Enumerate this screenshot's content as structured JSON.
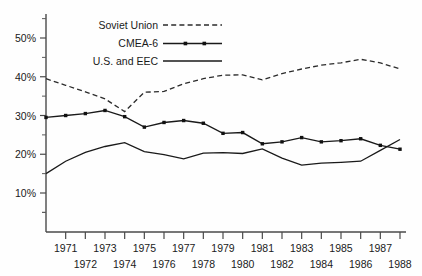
{
  "chart_data": {
    "type": "line",
    "title": "",
    "xlabel": "",
    "ylabel": "",
    "grid": false,
    "legend_position": "top-center",
    "x": [
      1970,
      1971,
      1972,
      1973,
      1974,
      1975,
      1976,
      1977,
      1978,
      1979,
      1980,
      1981,
      1982,
      1983,
      1984,
      1985,
      1986,
      1987,
      1988
    ],
    "categories": [
      "1970",
      "1971",
      "1972",
      "1973",
      "1974",
      "1975",
      "1976",
      "1977",
      "1978",
      "1979",
      "1980",
      "1981",
      "1982",
      "1983",
      "1984",
      "1985",
      "1986",
      "1987",
      "1988"
    ],
    "xlim": [
      1970,
      1988
    ],
    "ylim": [
      2.5,
      55
    ],
    "y_ticks_major": [
      10,
      20,
      30,
      40,
      50
    ],
    "y_ticks_major_labels": [
      "10%",
      "20%",
      "30%",
      "40%",
      "50%"
    ],
    "y_ticks_minor": [
      5,
      15,
      25,
      35,
      45,
      55
    ],
    "x_tick_labels_top": [
      "1971",
      "1973",
      "1975",
      "1977",
      "1979",
      "1981",
      "1983",
      "1985",
      "1987"
    ],
    "x_tick_labels_bottom": [
      "1972",
      "1974",
      "1976",
      "1978",
      "1980",
      "1982",
      "1984",
      "1986",
      "1988"
    ],
    "series": [
      {
        "name": "Soviet Union",
        "style": "dashed",
        "markers": false,
        "color": "#2b2b2b",
        "values": [
          39.5,
          37.8,
          36.1,
          34.3,
          31.0,
          36.0,
          36.2,
          38.2,
          39.5,
          40.4,
          40.5,
          39.2,
          40.8,
          42.0,
          43.0,
          43.6,
          44.5,
          43.6,
          42.0
        ]
      },
      {
        "name": "CMEA-6",
        "style": "solid",
        "markers": true,
        "color": "#1a1a1a",
        "values": [
          29.5,
          30.0,
          30.5,
          31.3,
          29.7,
          27.0,
          28.2,
          28.7,
          28.0,
          25.4,
          25.6,
          22.7,
          23.2,
          24.3,
          23.2,
          23.5,
          24.0,
          22.3,
          21.3
        ]
      },
      {
        "name": "U.S. and EEC",
        "style": "solid",
        "markers": false,
        "color": "#1a1a1a",
        "values": [
          15.0,
          18.2,
          20.5,
          22.0,
          23.0,
          20.7,
          19.9,
          18.8,
          20.3,
          20.4,
          20.2,
          21.4,
          19.0,
          17.2,
          17.7,
          17.9,
          18.2,
          21.0,
          23.8
        ]
      }
    ]
  },
  "legend": {
    "entries": [
      {
        "label": "Soviet Union",
        "sample": "dashed-line"
      },
      {
        "label": "CMEA-6",
        "sample": "line-with-markers"
      },
      {
        "label": "U.S. and EEC",
        "sample": "solid-line"
      }
    ]
  }
}
